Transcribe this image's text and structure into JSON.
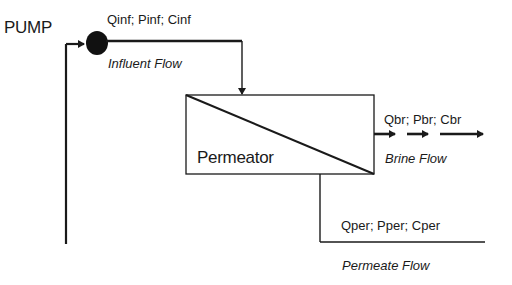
{
  "diagram": {
    "pump": {
      "label": "PUMP"
    },
    "influent": {
      "variables": "Qinf; Pinf; Cinf",
      "label": "Influent Flow"
    },
    "permeator": {
      "label": "Permeator"
    },
    "brine": {
      "variables": "Qbr; Pbr; Cbr",
      "label": "Brine Flow"
    },
    "permeate": {
      "variables": "Qper; Pper; Cper",
      "label": "Permeate Flow"
    }
  },
  "colors": {
    "line": "#1a1a1a",
    "background": "#ffffff"
  }
}
